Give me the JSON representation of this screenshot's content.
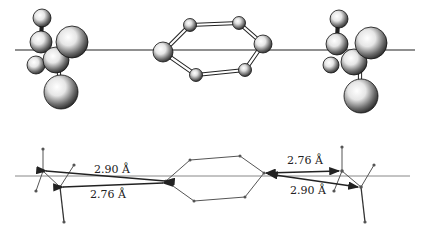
{
  "figure": {
    "labels": {
      "left_upper": "2.90 Å",
      "left_lower": "2.76 Å",
      "right_upper": "2.76 Å",
      "right_lower": "2.90 Å"
    },
    "distances_angstrom": {
      "left_upper": 2.9,
      "left_lower": 2.76,
      "right_upper": 2.76,
      "right_lower": 2.9
    },
    "colors": {
      "line": "#222222",
      "atom_shade": "#1a1a1a",
      "atom_highlight": "#ffffff",
      "background": "#ffffff"
    }
  }
}
